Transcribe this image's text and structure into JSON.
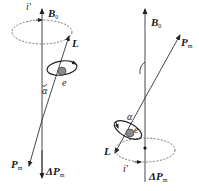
{
  "diagram": {
    "colors": {
      "line": "#333333",
      "electron": "#8a8a8a",
      "background": "#ffffff"
    },
    "left_panel": {
      "labels": {
        "field": "B",
        "field_sub": "0",
        "current": "i'",
        "angular_momentum": "L",
        "electron": "e",
        "angle": "α",
        "moment": "P",
        "moment_sub": "m",
        "delta_moment": "ΔP",
        "delta_moment_sub": "m"
      }
    },
    "right_panel": {
      "labels": {
        "field": "B",
        "field_sub": "0",
        "moment": "P",
        "moment_sub": "m",
        "angle": "α",
        "electron": "e",
        "angular_momentum": "L",
        "current": "i'",
        "delta_moment": "ΔP",
        "delta_moment_sub": "m"
      }
    }
  }
}
